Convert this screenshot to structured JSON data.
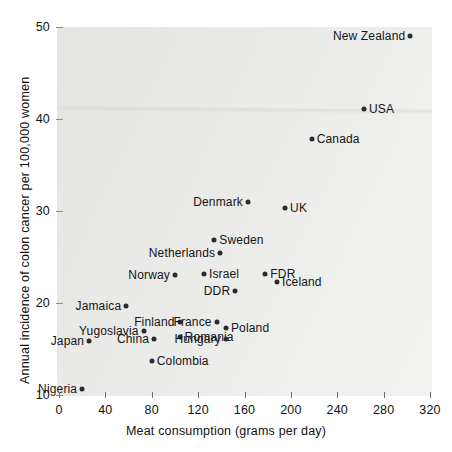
{
  "chart_data": {
    "type": "scatter",
    "title": "",
    "xlabel": "Meat consumption (grams per day)",
    "ylabel": "Annual incidence of colon cancer per 100,000 women",
    "xlim": [
      0,
      340
    ],
    "ylim": [
      10,
      50
    ],
    "xticks": [
      0,
      40,
      80,
      120,
      160,
      200,
      240,
      280,
      320
    ],
    "yticks": [
      10,
      20,
      30,
      40,
      50
    ],
    "grid": false,
    "legend": null,
    "points": [
      {
        "label": "New Zealand",
        "x": 303,
        "y": 49.0,
        "label_side": "left"
      },
      {
        "label": "USA",
        "x": 263,
        "y": 41.1,
        "label_side": "right"
      },
      {
        "label": "Canada",
        "x": 218,
        "y": 37.8,
        "label_side": "right"
      },
      {
        "label": "Denmark",
        "x": 163,
        "y": 31.0,
        "label_side": "left"
      },
      {
        "label": "UK",
        "x": 195,
        "y": 30.3,
        "label_side": "right"
      },
      {
        "label": "Sweden",
        "x": 134,
        "y": 26.9,
        "label_side": "right"
      },
      {
        "label": "Netherlands",
        "x": 139,
        "y": 25.4,
        "label_side": "left"
      },
      {
        "label": "Israel",
        "x": 125,
        "y": 23.2,
        "label_side": "right"
      },
      {
        "label": "FDR",
        "x": 178,
        "y": 23.2,
        "label_side": "right"
      },
      {
        "label": "Norway",
        "x": 100,
        "y": 23.0,
        "label_side": "left"
      },
      {
        "label": "Iceland",
        "x": 188,
        "y": 22.3,
        "label_side": "right"
      },
      {
        "label": "DDR",
        "x": 152,
        "y": 21.3,
        "label_side": "left"
      },
      {
        "label": "Jamaica",
        "x": 58,
        "y": 19.7,
        "label_side": "left"
      },
      {
        "label": "Finland",
        "x": 104,
        "y": 17.9,
        "label_side": "left"
      },
      {
        "label": "France",
        "x": 136,
        "y": 17.9,
        "label_side": "left"
      },
      {
        "label": "Poland",
        "x": 144,
        "y": 17.3,
        "label_side": "right"
      },
      {
        "label": "Yugoslavia",
        "x": 73,
        "y": 17.0,
        "label_side": "left"
      },
      {
        "label": "Romania",
        "x": 104,
        "y": 16.3,
        "label_side": "right"
      },
      {
        "label": "China",
        "x": 82,
        "y": 16.1,
        "label_side": "left"
      },
      {
        "label": "Hungary",
        "x": 144,
        "y": 16.1,
        "label_side": "left"
      },
      {
        "label": "Japan",
        "x": 26,
        "y": 15.9,
        "label_side": "left"
      },
      {
        "label": "Colombia",
        "x": 80,
        "y": 13.7,
        "label_side": "right"
      },
      {
        "label": "Nigeria",
        "x": 20,
        "y": 10.6,
        "label_side": "left"
      }
    ]
  },
  "axes": {
    "x_title": "Meat consumption (grams per day)",
    "y_title": "Annual incidence of colon cancer per 100,000 women",
    "x_tick_labels": [
      "0",
      "40",
      "80",
      "120",
      "160",
      "200",
      "240",
      "280",
      "320"
    ],
    "y_tick_labels": [
      "10",
      "20",
      "30",
      "40",
      "50"
    ]
  },
  "style": {
    "panel_bg": "#f2f2f0",
    "point_color": "#2b2b2b",
    "text_color": "#151515",
    "tick_color": "#6f6f6f"
  }
}
